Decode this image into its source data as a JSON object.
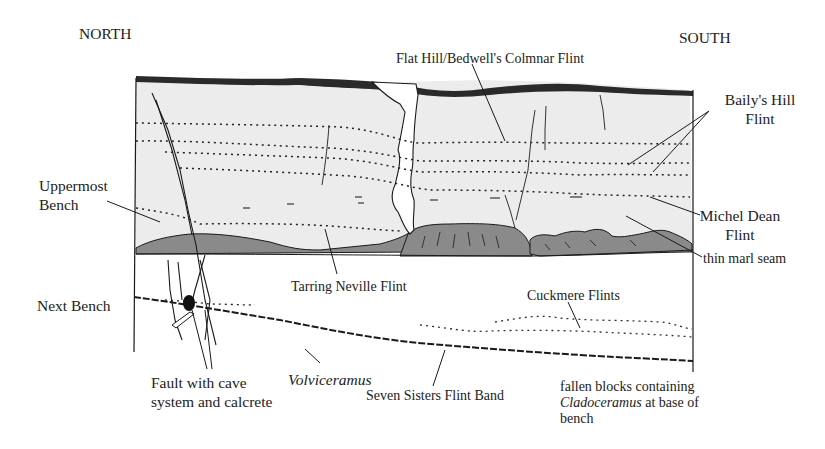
{
  "diagram": {
    "title_left": "NORTH",
    "title_right": "SOUTH",
    "colors": {
      "chalk": "#ececec",
      "marl_shade": "#8a8a8a",
      "ink": "#1a1a1a",
      "top_band": "#2a2a2a"
    },
    "labels": {
      "flat_hill": "Flat Hill/Bedwell's Colmnar Flint",
      "bailys_hill_1": "Baily's Hill",
      "bailys_hill_2": "Flint",
      "uppermost_bench_1": "Uppermost",
      "uppermost_bench_2": "Bench",
      "michel_dean_1": "Michel Dean",
      "michel_dean_2": "Flint",
      "thin_marl_seam": "thin marl seam",
      "tarring_neville": "Tarring Neville Flint",
      "next_bench": "Next Bench",
      "cuckmere": "Cuckmere Flints",
      "fault_1": "Fault with cave",
      "fault_2": "system and calcrete",
      "volviceramus": "Volviceramus",
      "seven_sisters": "Seven Sisters Flint Band",
      "fallen_1": "fallen blocks containing",
      "fallen_2_italic": "Cladoceramus",
      "fallen_2_rest": " at base of",
      "fallen_3": "bench"
    }
  }
}
